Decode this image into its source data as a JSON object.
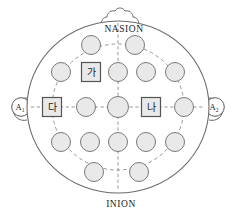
{
  "diagram": {
    "type": "head-map",
    "colors": {
      "electrode_fill": "#e9e9e9",
      "electrode_stroke": "#7a7a7a",
      "head_stroke": "#6b6b6b",
      "grid_stroke": "#8a8a8a",
      "background": "#ffffff",
      "label_text": "#1d1d1d"
    },
    "anatomy_labels": {
      "top": "NASION",
      "bottom": "INION"
    },
    "ear_references": [
      {
        "id": "ear-left",
        "base": "A",
        "sub": "1",
        "side": "left"
      },
      {
        "id": "ear-right",
        "base": "A",
        "sub": "2",
        "side": "right"
      }
    ],
    "electrodes": [
      {
        "id": "e1",
        "row": 1,
        "col": 1,
        "cx": 91,
        "cy": 45,
        "r": 9.5,
        "shape": "circle",
        "label": ""
      },
      {
        "id": "e2",
        "row": 1,
        "col": 2,
        "cx": 135,
        "cy": 45,
        "r": 9.5,
        "shape": "circle",
        "label": ""
      },
      {
        "id": "e3",
        "row": 2,
        "col": 1,
        "cx": 61,
        "cy": 72,
        "r": 9.5,
        "shape": "circle",
        "label": ""
      },
      {
        "id": "e4",
        "row": 2,
        "col": 2,
        "cx": 91,
        "cy": 72,
        "r": 9.5,
        "shape": "square",
        "label": "가"
      },
      {
        "id": "e5",
        "row": 2,
        "col": 3,
        "cx": 118,
        "cy": 72,
        "r": 9.5,
        "shape": "circle",
        "label": ""
      },
      {
        "id": "e6",
        "row": 2,
        "col": 4,
        "cx": 146,
        "cy": 72,
        "r": 9.5,
        "shape": "circle",
        "label": ""
      },
      {
        "id": "e7",
        "row": 2,
        "col": 5,
        "cx": 175,
        "cy": 72,
        "r": 9.5,
        "shape": "circle",
        "label": ""
      },
      {
        "id": "e8",
        "row": 3,
        "col": 1,
        "cx": 52,
        "cy": 107,
        "r": 9.5,
        "shape": "square",
        "label": "다"
      },
      {
        "id": "e9",
        "row": 3,
        "col": 2,
        "cx": 86,
        "cy": 107,
        "r": 9.5,
        "shape": "circle",
        "label": ""
      },
      {
        "id": "e10",
        "row": 3,
        "col": 3,
        "cx": 118,
        "cy": 107,
        "r": 10.5,
        "shape": "circle",
        "label": ""
      },
      {
        "id": "e11",
        "row": 3,
        "col": 4,
        "cx": 151,
        "cy": 107,
        "r": 9.5,
        "shape": "square",
        "label": "나"
      },
      {
        "id": "e12",
        "row": 3,
        "col": 5,
        "cx": 184,
        "cy": 107,
        "r": 9.5,
        "shape": "circle",
        "label": ""
      },
      {
        "id": "e13",
        "row": 4,
        "col": 1,
        "cx": 61,
        "cy": 142,
        "r": 9.5,
        "shape": "circle",
        "label": ""
      },
      {
        "id": "e14",
        "row": 4,
        "col": 2,
        "cx": 90,
        "cy": 142,
        "r": 9.5,
        "shape": "circle",
        "label": ""
      },
      {
        "id": "e15",
        "row": 4,
        "col": 3,
        "cx": 118,
        "cy": 142,
        "r": 9.5,
        "shape": "circle",
        "label": ""
      },
      {
        "id": "e16",
        "row": 4,
        "col": 4,
        "cx": 146,
        "cy": 142,
        "r": 9.5,
        "shape": "circle",
        "label": ""
      },
      {
        "id": "e17",
        "row": 4,
        "col": 5,
        "cx": 175,
        "cy": 142,
        "r": 9.5,
        "shape": "circle",
        "label": ""
      },
      {
        "id": "e18",
        "row": 5,
        "col": 1,
        "cx": 94,
        "cy": 172,
        "r": 9.5,
        "shape": "circle",
        "label": ""
      },
      {
        "id": "e19",
        "row": 5,
        "col": 2,
        "cx": 139,
        "cy": 172,
        "r": 9.5,
        "shape": "circle",
        "label": ""
      }
    ],
    "labeled_electrodes": [
      {
        "label": "가",
        "position": "front-left"
      },
      {
        "label": "나",
        "position": "mid-right"
      },
      {
        "label": "다",
        "position": "mid-left"
      }
    ]
  }
}
